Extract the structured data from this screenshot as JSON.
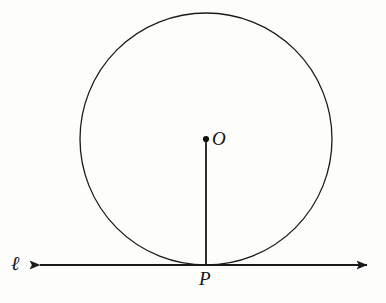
{
  "figure": {
    "type": "geometry-diagram",
    "background_color": "#fdfdfc",
    "stroke_color": "#1a1a1a",
    "labels": {
      "center": "O",
      "tangent_point": "P",
      "line": "ℓ"
    },
    "geometry": {
      "circle": {
        "center_x": 206,
        "center_y": 139,
        "radius": 126,
        "stroke_width": 1.3
      },
      "center_dot": {
        "cx": 206,
        "cy": 139,
        "r": 3.1
      },
      "radius_segment": {
        "x1": 206,
        "y1": 139,
        "x2": 206,
        "y2": 265,
        "stroke_width": 1.8
      },
      "tangent_line": {
        "y": 265,
        "x_start": 34,
        "x_end": 373,
        "stroke_width": 2,
        "arrow_left": true,
        "arrow_right": true
      },
      "tangent_point": {
        "x": 206,
        "y": 265
      }
    }
  }
}
